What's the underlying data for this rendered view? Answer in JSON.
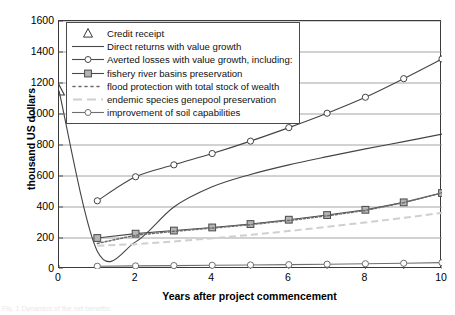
{
  "chart_data": {
    "type": "line",
    "title": "",
    "xlabel": "Years after project commencement",
    "ylabel": "thousand US dollars",
    "xlim": [
      0,
      10
    ],
    "ylim": [
      0,
      1600
    ],
    "xticks": [
      0,
      1,
      2,
      3,
      4,
      5,
      6,
      7,
      8,
      9,
      10
    ],
    "xtick_labels": [
      "0",
      "2",
      "4",
      "6",
      "8",
      "10"
    ],
    "xtick_label_values": [
      0,
      2,
      4,
      6,
      8,
      10
    ],
    "yticks": [
      0,
      200,
      400,
      600,
      800,
      1000,
      1200,
      1400,
      1600
    ],
    "ytick_labels": [
      "0",
      "200",
      "400",
      "600",
      "800",
      "1000",
      "1200",
      "1400",
      "1600"
    ],
    "grid": "horizontal",
    "legend_position": "upper-left-inside",
    "x": [
      0,
      1,
      2,
      3,
      4,
      5,
      6,
      7,
      8,
      9,
      10
    ],
    "series": [
      {
        "name": "Credit receipt",
        "marker": "triangle-open",
        "line": "none",
        "color": "#3a3a3a",
        "points": [
          {
            "x": 0,
            "y": 1150
          }
        ],
        "values": [
          1150,
          null,
          null,
          null,
          null,
          null,
          null,
          null,
          null,
          null,
          null
        ]
      },
      {
        "name": "Direct returns with value growth",
        "marker": "none",
        "line": "solid",
        "color": "#444444",
        "values": [
          1150,
          115,
          175,
          400,
          530,
          610,
          672,
          725,
          775,
          822,
          870
        ]
      },
      {
        "name": "Averted losses with value growth, including:",
        "marker": "circle-open",
        "line": "solid",
        "color": "#444444",
        "values": [
          null,
          440,
          595,
          672,
          745,
          825,
          912,
          1005,
          1108,
          1228,
          1355
        ]
      },
      {
        "name": "fishery river basins preservation",
        "marker": "square-filled-gray",
        "line": "solid",
        "color": "#4a4a4a",
        "marker_fill": "#b4b4b4",
        "values": [
          null,
          200,
          228,
          248,
          268,
          290,
          318,
          348,
          382,
          430,
          490
        ]
      },
      {
        "name": "flood protection with total stock of wealth",
        "marker": "none",
        "line": "dotted",
        "color": "#6b6b6b",
        "values": [
          null,
          165,
          218,
          243,
          264,
          286,
          313,
          343,
          378,
          428,
          492
        ]
      },
      {
        "name": "endemic species genepool preservation",
        "marker": "none",
        "line": "dashed-light",
        "color": "#cfcfcf",
        "values": [
          null,
          150,
          160,
          178,
          198,
          220,
          245,
          272,
          300,
          330,
          362
        ]
      },
      {
        "name": "improvement of soil capabilities",
        "marker": "circle-open",
        "line": "solid",
        "color": "#6f6f6f",
        "values": [
          null,
          18,
          20,
          22,
          24,
          26,
          28,
          31,
          34,
          37,
          41
        ]
      }
    ],
    "legend_entries": [
      {
        "label": "Credit receipt",
        "key": "triangle-open"
      },
      {
        "label": "Direct returns with value growth",
        "key": "solid-line"
      },
      {
        "label": "Averted losses with value growth, including:",
        "key": "circle-line"
      },
      {
        "label": "fishery river basins preservation",
        "key": "square-line"
      },
      {
        "label": "flood protection with total stock of wealth",
        "key": "dotted-line"
      },
      {
        "label": "endemic species genepool preservation",
        "key": "light-dashed-line"
      },
      {
        "label": "improvement of soil capabilities",
        "key": "circle-line-gray"
      }
    ]
  },
  "caption": "Fig. 1  Dynamics of the net benefits"
}
